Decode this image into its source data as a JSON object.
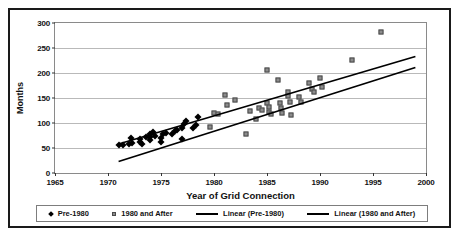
{
  "chart_data": {
    "type": "scatter",
    "title": "",
    "xlabel": "Year of Grid Connection",
    "ylabel": "Months",
    "xlim": [
      1965,
      2000
    ],
    "ylim": [
      0,
      300
    ],
    "xticks": [
      1965,
      1970,
      1975,
      1980,
      1985,
      1990,
      1995,
      2000
    ],
    "yticks": [
      0,
      50,
      100,
      150,
      200,
      250,
      300
    ],
    "grid": true,
    "legend_position": "bottom",
    "series": [
      {
        "name": "Pre-1980",
        "marker": "diamond",
        "color": "#000000",
        "points": [
          [
            1971,
            56
          ],
          [
            1971.4,
            57
          ],
          [
            1972,
            58
          ],
          [
            1972.3,
            60
          ],
          [
            1972.2,
            70
          ],
          [
            1973,
            62
          ],
          [
            1973,
            68
          ],
          [
            1973.2,
            58
          ],
          [
            1973.6,
            72
          ],
          [
            1974,
            66
          ],
          [
            1974,
            72
          ],
          [
            1974,
            78
          ],
          [
            1974.2,
            82
          ],
          [
            1974.4,
            74
          ],
          [
            1975,
            62
          ],
          [
            1975,
            70
          ],
          [
            1975.2,
            78
          ],
          [
            1975.5,
            80
          ],
          [
            1976,
            78
          ],
          [
            1976.3,
            84
          ],
          [
            1976.5,
            86
          ],
          [
            1977,
            68
          ],
          [
            1977,
            90
          ],
          [
            1977.2,
            98
          ],
          [
            1977.4,
            105
          ],
          [
            1978,
            90
          ],
          [
            1978.3,
            96
          ],
          [
            1978.5,
            112
          ]
        ]
      },
      {
        "name": "1980 and After",
        "marker": "square",
        "color": "#8c8c8c",
        "points": [
          [
            1979.6,
            92
          ],
          [
            1980,
            120
          ],
          [
            1980.4,
            118
          ],
          [
            1981,
            157
          ],
          [
            1981.2,
            136
          ],
          [
            1982,
            147
          ],
          [
            1983,
            79
          ],
          [
            1983.4,
            124
          ],
          [
            1984,
            108
          ],
          [
            1984.2,
            130
          ],
          [
            1984.5,
            127
          ],
          [
            1985,
            207
          ],
          [
            1985,
            140
          ],
          [
            1985.2,
            122
          ],
          [
            1985.2,
            133
          ],
          [
            1985.4,
            118
          ],
          [
            1986,
            186
          ],
          [
            1986.2,
            140
          ],
          [
            1986.3,
            130
          ],
          [
            1986.4,
            120
          ],
          [
            1987,
            163
          ],
          [
            1987,
            155
          ],
          [
            1987.2,
            143
          ],
          [
            1987.3,
            116
          ],
          [
            1988,
            152
          ],
          [
            1988.2,
            143
          ],
          [
            1989,
            180
          ],
          [
            1989.2,
            168
          ],
          [
            1989.4,
            163
          ],
          [
            1990,
            190
          ],
          [
            1990.2,
            172
          ],
          [
            1993,
            227
          ],
          [
            1995.8,
            283
          ]
        ]
      }
    ],
    "trendlines": [
      {
        "name": "Linear (Pre-1980)",
        "color": "#000000",
        "x0": 1971.0,
        "y0": 58,
        "x1": 1999.0,
        "y1": 233
      },
      {
        "name": "Linear (1980 and After)",
        "color": "#000000",
        "x0": 1971.0,
        "y0": 23,
        "x1": 1999.0,
        "y1": 211
      }
    ]
  },
  "legend": {
    "items": [
      {
        "label": "Pre-1980",
        "marker": "diamond"
      },
      {
        "label": "1980 and After",
        "marker": "square"
      },
      {
        "label": "Linear (Pre-1980)",
        "marker": "line"
      },
      {
        "label": "Linear (1980 and After)",
        "marker": "line"
      }
    ]
  }
}
